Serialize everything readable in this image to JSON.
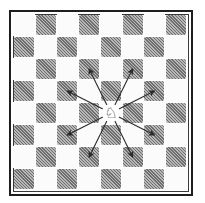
{
  "diagram": {
    "title": "",
    "board": {
      "rows": 8,
      "cols": 8,
      "top_left_color": "light",
      "light_color": "#fbfbfb",
      "dark_color": "#8a8a8a",
      "border_color": "#1e1e1e"
    },
    "piece": {
      "type": "knight",
      "color": "white",
      "glyph": "♘",
      "row": 4,
      "col": 4
    },
    "moves": [
      {
        "row": 2,
        "col": 3,
        "label": "up-left"
      },
      {
        "row": 2,
        "col": 5,
        "label": "up-right"
      },
      {
        "row": 3,
        "col": 2,
        "label": "left-up"
      },
      {
        "row": 3,
        "col": 6,
        "label": "right-up"
      },
      {
        "row": 5,
        "col": 2,
        "label": "left-down"
      },
      {
        "row": 5,
        "col": 6,
        "label": "right-down"
      },
      {
        "row": 6,
        "col": 3,
        "label": "down-left"
      },
      {
        "row": 6,
        "col": 5,
        "label": "down-right"
      }
    ],
    "arrow_color": "#2a2a2a"
  }
}
